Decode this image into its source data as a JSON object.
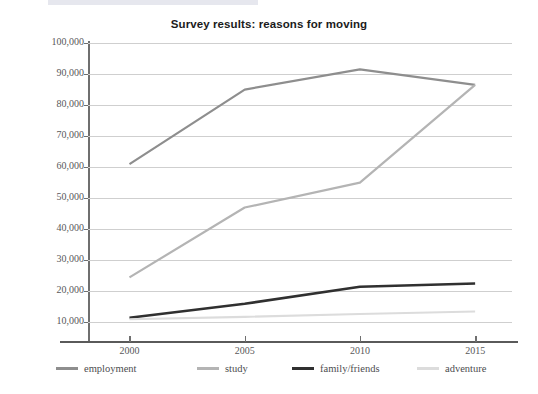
{
  "chart_data": {
    "type": "line",
    "title": "Survey results: reasons for moving",
    "xlabel": "",
    "ylabel": "",
    "x": [
      2000,
      2005,
      2010,
      2015
    ],
    "categories": [
      "2000",
      "2005",
      "2010",
      "2015"
    ],
    "xtick_labels": [
      "2000",
      "2005",
      "2010",
      "2015"
    ],
    "ytick_labels": [
      "100,000",
      "90,000",
      "80,000",
      "70,000",
      "60,000",
      "50,000",
      "40,000",
      "30,000",
      "20,000",
      "10,000"
    ],
    "ytick_values": [
      100000,
      90000,
      80000,
      70000,
      60000,
      50000,
      40000,
      30000,
      20000,
      10000
    ],
    "ylim": [
      4000,
      100000
    ],
    "xlim": [
      1998.2,
      2016.6
    ],
    "grid": true,
    "legend_position": "bottom",
    "series": [
      {
        "name": "employment",
        "color": "#8e8e8e",
        "width": 2.2,
        "values": [
          61000,
          85000,
          91500,
          86500
        ]
      },
      {
        "name": "study",
        "color": "#b4b4b4",
        "width": 2.2,
        "values": [
          24500,
          47000,
          55000,
          86500
        ]
      },
      {
        "name": "family/friends",
        "color": "#303030",
        "width": 2.6,
        "values": [
          11500,
          16000,
          21500,
          22500
        ]
      },
      {
        "name": "adventure",
        "color": "#dcdcdc",
        "width": 2.2,
        "values": [
          11000,
          11800,
          12700,
          13500
        ]
      }
    ]
  },
  "legend": {
    "items": [
      {
        "label": "employment",
        "color": "#8e8e8e",
        "x": 56
      },
      {
        "label": "study",
        "color": "#b4b4b4",
        "x": 197
      },
      {
        "label": "family/friends",
        "color": "#303030",
        "x": 292
      },
      {
        "label": "adventure",
        "color": "#dcdcdc",
        "x": 417
      }
    ]
  },
  "colors": {
    "axis": "#5a5a5a",
    "grid": "#cfcfcf",
    "tick_text": "#58585a",
    "title_text": "#1b1b1b",
    "background": "#ffffff"
  },
  "artifacts": {
    "top_strip": "",
    "marks": [
      "",
      "",
      ""
    ]
  }
}
